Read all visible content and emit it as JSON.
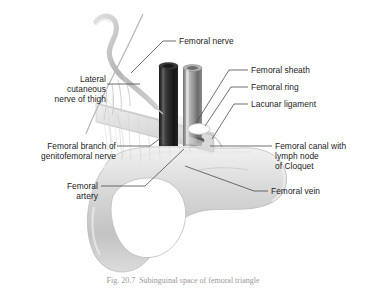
{
  "figure": {
    "background_color": "#ffffff",
    "text_color": "#1b1b1b",
    "leader_line_color": "#4a4a4a",
    "caption": "Fig. 20.7  Subinguinal space of femoral triangle"
  },
  "labels": {
    "femoral_nerve": "Femoral nerve",
    "femoral_sheath": "Femoral sheath",
    "femoral_ring": "Femoral ring",
    "lacunar_ligament": "Lacunar ligament",
    "lateral_cutaneous_nerve": "Lateral\ncutaneous\nnerve of thigh",
    "femoral_branch_genitofemoral": "Femoral branch of\ngenitofemoral nerve",
    "femoral_artery": "Femoral\nartery",
    "femoral_canal": "Femoral canal with\nlymph node\nof Cloquet",
    "femoral_vein": "Femoral vein"
  },
  "structures": {
    "femoral_artery_vessel": {
      "name": "femoral artery",
      "color": "#2a2a2a",
      "description": "dark cut cylinder, left of pair"
    },
    "femoral_vein_vessel": {
      "name": "femoral vein",
      "color": "#8e8e8e",
      "description": "lighter cut cylinder, right of pair"
    },
    "femoral_ring_opening": {
      "name": "femoral ring",
      "color": "#ffffff",
      "description": "white oval opening medial to vein"
    },
    "lymph_node_cloquet": {
      "name": "lymph node of Cloquet",
      "color": "#555555",
      "description": "small dark nodule within femoral canal"
    },
    "hip_bone": {
      "name": "hip bone with obturator foramen",
      "color": "#cfcfcf"
    },
    "inguinal_ligament": {
      "name": "inguinal ligament",
      "color": "#c4c4c4"
    },
    "nerve_trunk": {
      "name": "lateral cutaneous nerve of thigh",
      "color": "#bdbdbd"
    }
  }
}
